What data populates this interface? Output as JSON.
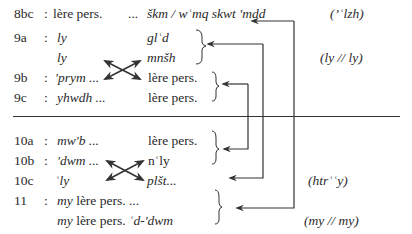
{
  "rows": [
    {
      "id": "8bc",
      "colon": ":",
      "left": "lère pers.",
      "middle": "...",
      "right": "škm / wʿmq skwt 'mdd",
      "annotation": "(ʼʿlzh)"
    },
    {
      "id": "9a",
      "colon": ":",
      "left": "ly",
      "right": "glʿd"
    },
    {
      "id": "",
      "colon": "",
      "left": "ly",
      "right": "mnšh"
    },
    {
      "id": "9b",
      "colon": ":",
      "left": "'prym ...",
      "right": "lère pers."
    },
    {
      "id": "9c",
      "colon": ":",
      "left": "yhwdh ...",
      "right": "lère pers."
    },
    {
      "id": "10a",
      "colon": ":",
      "left": "mw'b ...",
      "right": "lère pers."
    },
    {
      "id": "10b",
      "colon": ":",
      "left": "'dwm ...",
      "right": "nʿly"
    },
    {
      "id": "10c",
      "colon": "",
      "left": "ʿly",
      "right": "plšt...",
      "annotation": "(htrʿʿy)"
    },
    {
      "id": "11",
      "colon": ":",
      "left_italic": "my",
      "left_rest": " lère pers. ..."
    },
    {
      "id": "",
      "colon": "",
      "left_italic": "my",
      "left_rest": " lère pers. ",
      "left_tail": "ʿd-'dwm",
      "annotation": "(my // my)"
    }
  ],
  "annotations": {
    "group_9a": "(ly // ly)"
  },
  "colors": {
    "text": "#2a2a2a",
    "lines": "#333333"
  }
}
